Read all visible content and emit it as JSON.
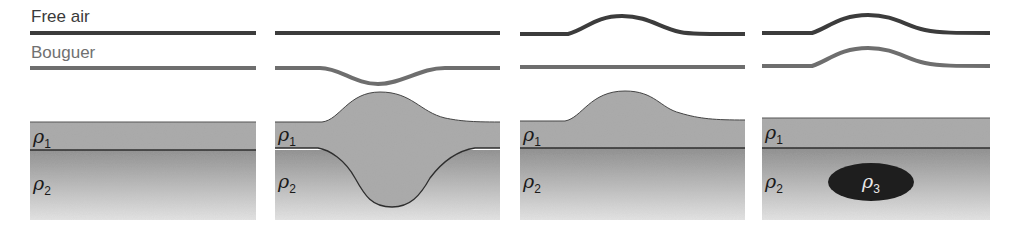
{
  "labels": {
    "free_air": "Free air",
    "bouguer": "Bouguer"
  },
  "symbols": {
    "rho1": "ρ",
    "rho1_sub": "1",
    "rho2": "ρ",
    "rho2_sub": "2",
    "rho3": "ρ",
    "rho3_sub": "3"
  },
  "colors": {
    "free_air_line": "#3c3c3c",
    "bouguer_line": "#6e6e6e",
    "layer1_fill": "#a8a8a8",
    "layer2_top": "#8e8e8e",
    "layer2_bottom": "#e2e2e2",
    "boundary_line": "#2e2e2e",
    "body_rho3": "#1e1e1e"
  },
  "panels": [
    {
      "id": 1,
      "description": "Flat layers, no topography",
      "free_air_anomaly": "flat",
      "bouguer_anomaly": "flat"
    },
    {
      "id": 2,
      "description": "Mountain with compensating root (isostatic)",
      "free_air_anomaly": "flat",
      "bouguer_anomaly": "negative low"
    },
    {
      "id": 3,
      "description": "Mountain without root (uncompensated)",
      "free_air_anomaly": "positive high",
      "bouguer_anomaly": "flat"
    },
    {
      "id": 4,
      "description": "Flat surface with dense buried body rho3",
      "free_air_anomaly": "positive high",
      "bouguer_anomaly": "positive high"
    }
  ]
}
